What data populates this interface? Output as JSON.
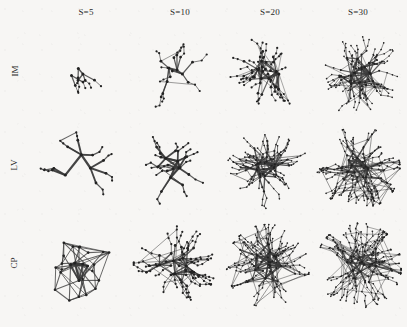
{
  "figure": {
    "type": "network-graph-grid",
    "background_color": "#f7f6f4",
    "ink_color": "#3a3a3a",
    "node_color": "#222222",
    "width": 407,
    "height": 327,
    "rows": 3,
    "cols": 4
  },
  "columns": [
    {
      "label": "S=5",
      "value": 5,
      "x_center": 86,
      "cell_x": 30,
      "cell_w": 95
    },
    {
      "label": "S=10",
      "value": 10,
      "x_center": 180,
      "cell_x": 127,
      "cell_w": 95
    },
    {
      "label": "S=20",
      "value": 20,
      "x_center": 270,
      "cell_x": 222,
      "cell_w": 92
    },
    {
      "label": "S=30",
      "value": 30,
      "x_center": 358,
      "cell_x": 312,
      "cell_w": 93
    }
  ],
  "rows": [
    {
      "label": "IM",
      "y": 28,
      "h": 92
    },
    {
      "label": "LV",
      "y": 122,
      "h": 92
    },
    {
      "label": "CP",
      "y": 216,
      "h": 100
    }
  ],
  "chart_data": {
    "type": "scatter",
    "title": "",
    "xlabel": "",
    "ylabel": "",
    "grid": false,
    "legend": "none",
    "categories": [
      "S=5",
      "S=10",
      "S=20",
      "S=30"
    ],
    "series": [
      {
        "name": "IM",
        "values": [
          1,
          2,
          4,
          6
        ]
      },
      {
        "name": "LV",
        "values": [
          2,
          3,
          6,
          8
        ]
      },
      {
        "name": "CP",
        "values": [
          3,
          5,
          7,
          9
        ]
      }
    ],
    "note": "Values encode relative visual edge-density / complexity of each network panel on an arbitrary 1-10 scale read from the rendered ink coverage."
  },
  "cells": [
    {
      "row": "IM",
      "col": "S=5",
      "nodes": 17,
      "hubs": 3,
      "seed": 11,
      "density": 1,
      "spread": 0.78,
      "thickness": 1.0,
      "branch": 1
    },
    {
      "row": "IM",
      "col": "S=10",
      "nodes": 34,
      "hubs": 4,
      "seed": 23,
      "density": 2,
      "spread": 0.82,
      "thickness": 1.0,
      "branch": 1
    },
    {
      "row": "IM",
      "col": "S=20",
      "nodes": 95,
      "hubs": 6,
      "seed": 37,
      "density": 4,
      "spread": 0.86,
      "thickness": 0.9,
      "branch": 2
    },
    {
      "row": "IM",
      "col": "S=30",
      "nodes": 165,
      "hubs": 8,
      "seed": 41,
      "density": 6,
      "spread": 0.9,
      "thickness": 0.9,
      "branch": 2
    },
    {
      "row": "LV",
      "col": "S=5",
      "nodes": 30,
      "hubs": 3,
      "seed": 53,
      "density": 2,
      "spread": 0.8,
      "thickness": 1.5,
      "branch": 1
    },
    {
      "row": "LV",
      "col": "S=10",
      "nodes": 48,
      "hubs": 4,
      "seed": 67,
      "density": 3,
      "spread": 0.84,
      "thickness": 1.4,
      "branch": 1
    },
    {
      "row": "LV",
      "col": "S=20",
      "nodes": 140,
      "hubs": 6,
      "seed": 73,
      "density": 6,
      "spread": 0.88,
      "thickness": 1.1,
      "branch": 2
    },
    {
      "row": "LV",
      "col": "S=30",
      "nodes": 215,
      "hubs": 7,
      "seed": 89,
      "density": 8,
      "spread": 0.9,
      "thickness": 1.0,
      "branch": 3
    },
    {
      "row": "CP",
      "col": "S=5",
      "nodes": 26,
      "hubs": 5,
      "seed": 97,
      "density": 3,
      "spread": 0.82,
      "thickness": 1.1,
      "branch": 0
    },
    {
      "row": "CP",
      "col": "S=10",
      "nodes": 130,
      "hubs": 5,
      "seed": 103,
      "density": 5,
      "spread": 0.86,
      "thickness": 1.0,
      "branch": 2
    },
    {
      "row": "CP",
      "col": "S=20",
      "nodes": 185,
      "hubs": 6,
      "seed": 109,
      "density": 7,
      "spread": 0.9,
      "thickness": 1.0,
      "branch": 3
    },
    {
      "row": "CP",
      "col": "S=30",
      "nodes": 255,
      "hubs": 6,
      "seed": 127,
      "density": 9,
      "spread": 0.92,
      "thickness": 0.9,
      "branch": 3
    }
  ]
}
